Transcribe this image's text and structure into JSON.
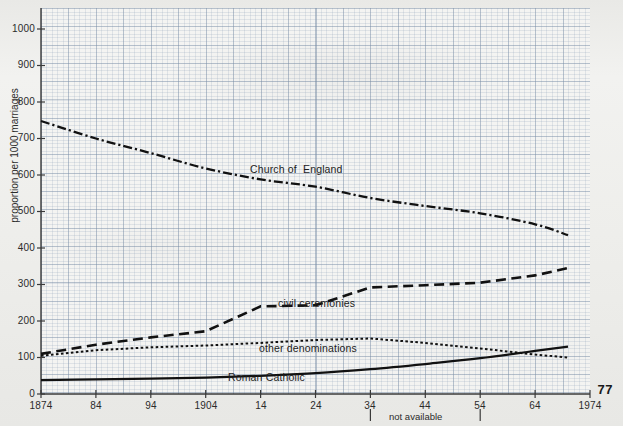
{
  "page": {
    "number": "77",
    "background_color": "#eeeeec",
    "ink_color": "#111111",
    "grid_color": "#8ba0b8"
  },
  "chart_data": {
    "type": "line",
    "title": "",
    "xlabel": "",
    "ylabel": "proportion per 1000 marriages",
    "xlim": [
      1874,
      1974
    ],
    "ylim": [
      0,
      1050
    ],
    "grid": true,
    "legend_position": "inline-labels",
    "y_ticks": [
      0,
      100,
      200,
      300,
      400,
      500,
      600,
      700,
      800,
      900,
      1000
    ],
    "y_tick_labels": [
      "0",
      "100",
      "200",
      "300",
      "400",
      "500",
      "600",
      "700",
      "800",
      "900",
      "1000"
    ],
    "x_ticks": [
      1874,
      1884,
      1894,
      1904,
      1914,
      1924,
      1934,
      1944,
      1954,
      1964,
      1974
    ],
    "x_tick_labels": [
      "1874",
      "84",
      "94",
      "1904",
      "14",
      "24",
      "34",
      "44",
      "54",
      "64",
      "1974"
    ],
    "annotations": [
      {
        "text": "not available",
        "x_from": 1934,
        "x_to": 1954,
        "note": "gap in data between 1934 and 1954 marked below the x-axis"
      }
    ],
    "series": [
      {
        "name": "Church of England",
        "label": "Church of  England",
        "style": "dash-dot",
        "x": [
          1874,
          1884,
          1894,
          1904,
          1914,
          1924,
          1934,
          1944,
          1954,
          1964,
          1970
        ],
        "values": [
          748,
          700,
          660,
          618,
          588,
          568,
          537,
          515,
          495,
          465,
          435
        ]
      },
      {
        "name": "civil ceremonies",
        "label": "civil ceremonies",
        "style": "dashed",
        "x": [
          1874,
          1884,
          1894,
          1904,
          1914,
          1924,
          1934,
          1944,
          1954,
          1964,
          1970
        ],
        "values": [
          110,
          135,
          155,
          172,
          240,
          243,
          292,
          298,
          305,
          325,
          345
        ]
      },
      {
        "name": "other denominations",
        "label": "other denominations",
        "style": "dotted",
        "x": [
          1874,
          1884,
          1894,
          1904,
          1914,
          1924,
          1934,
          1944,
          1954,
          1964,
          1970
        ],
        "values": [
          105,
          120,
          128,
          133,
          140,
          148,
          152,
          140,
          125,
          108,
          100
        ]
      },
      {
        "name": "Roman Catholic",
        "label": "Roman Catholic",
        "style": "solid",
        "x": [
          1874,
          1884,
          1894,
          1904,
          1914,
          1924,
          1934,
          1944,
          1954,
          1964,
          1970
        ],
        "values": [
          38,
          40,
          42,
          45,
          50,
          57,
          68,
          82,
          98,
          118,
          130
        ]
      }
    ]
  }
}
